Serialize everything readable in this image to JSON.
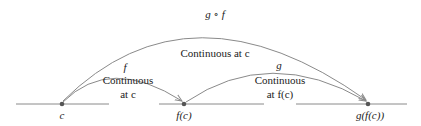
{
  "diagram": {
    "points": [
      {
        "label": "c",
        "x": 62
      },
      {
        "label": "f(c)",
        "x": 184
      },
      {
        "label": "g(f(c))",
        "x": 368
      }
    ],
    "arcs": {
      "f": {
        "name": "f",
        "text_line1": "Continuous",
        "text_line2": "at c"
      },
      "g": {
        "name": "g",
        "text_line1": "Continuous",
        "text_line2": "at f(c)"
      },
      "gf": {
        "name": "g ∘ f",
        "text": "Continuous at c"
      }
    },
    "colors": {
      "line": "#8a8a8a",
      "dot": "#555555",
      "text": "#222222"
    }
  }
}
